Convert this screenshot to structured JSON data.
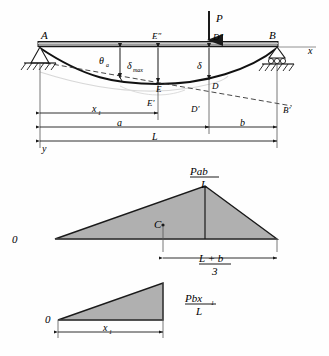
{
  "figure": {
    "colors": {
      "beam_fill": "#9a9a9a",
      "beam_edge": "#1a1a1a",
      "diagram_fill": "#b0b0b0",
      "diagram_edge": "#1a1a1a",
      "line": "#1a1a1a",
      "thin_line": "#555555",
      "background": "#fefefe",
      "ghost_curve": "#cfcfcf"
    }
  },
  "beam_diagram": {
    "labels": {
      "support_left": "A",
      "support_right": "B",
      "load": "P",
      "axis_x": "x",
      "axis_y": "y",
      "slope_angle": "θ",
      "slope_angle_sub": "a",
      "delta_max": "δ",
      "delta_max_sub": "max",
      "delta": "δ",
      "point_E": "E",
      "point_E_prime": "E'",
      "point_E_dprime": "E″",
      "point_D": "D",
      "point_D_prime": "D'",
      "point_D_dprime": "D″",
      "point_B_prime": "B'"
    },
    "dimensions": [
      {
        "name": "x1",
        "label": "x",
        "sub": "1"
      },
      {
        "name": "a",
        "label": "a",
        "sub": ""
      },
      {
        "name": "b",
        "label": "b",
        "sub": ""
      },
      {
        "name": "L",
        "label": "L",
        "sub": ""
      }
    ]
  },
  "moment_diagram": {
    "zero_label": "0",
    "peak_numerator": "Pab",
    "peak_denominator": "L",
    "centroid_label": "C",
    "dimension_numerator": "L + b",
    "dimension_denominator": "3"
  },
  "partial_moment_diagram": {
    "zero_label": "0",
    "peak_numerator": "Pbx",
    "peak_numerator_sub": "1",
    "peak_denominator": "L",
    "dimension_label": "x",
    "dimension_sub": "1"
  }
}
